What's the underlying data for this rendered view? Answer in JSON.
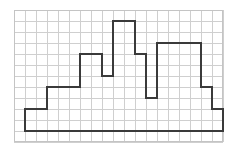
{
  "figure": {
    "background_color": "#ffffff",
    "grid": {
      "line_color": "#cfcfcf",
      "border_color": "#c4c4c4",
      "cell_size_px": 11,
      "columns": 19,
      "rows": 12,
      "origin_x_px": 14,
      "origin_y_px": 10,
      "width_px": 209,
      "height_px": 132
    },
    "polygon": {
      "stroke_color": "#3a3a3a",
      "stroke_width_px": 2,
      "fill": "none",
      "units": "grid-cells",
      "vertices": [
        [
          1,
          11
        ],
        [
          1,
          9
        ],
        [
          3,
          9
        ],
        [
          3,
          7
        ],
        [
          6,
          7
        ],
        [
          6,
          4
        ],
        [
          8,
          4
        ],
        [
          8,
          6
        ],
        [
          9,
          6
        ],
        [
          9,
          1
        ],
        [
          11,
          1
        ],
        [
          11,
          4
        ],
        [
          12,
          4
        ],
        [
          12,
          8
        ],
        [
          13,
          8
        ],
        [
          13,
          3
        ],
        [
          17,
          3
        ],
        [
          17,
          7
        ],
        [
          18,
          7
        ],
        [
          18,
          9
        ],
        [
          19,
          9
        ],
        [
          19,
          11
        ]
      ]
    }
  }
}
